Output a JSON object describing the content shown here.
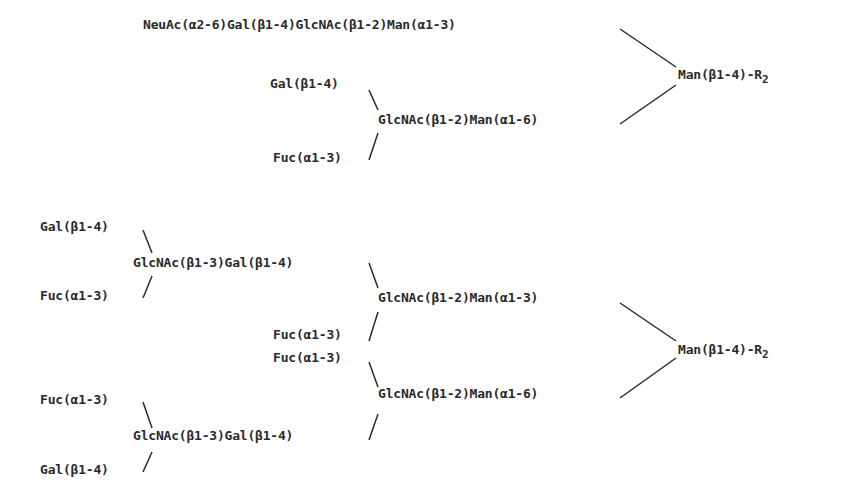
{
  "structure_1": {
    "branch_a3": "NeuAc(α2-6)Gal(β1-4)GlcNAc(β1-2)Man(α1-3)",
    "branch_a6_gal": "Gal(β1-4)",
    "branch_a6_core": "GlcNAc(β1-2)Man(α1-6)",
    "branch_a6_fuc": "Fuc(α1-3)",
    "core": "Man(β1-4)-R",
    "core_subscript": "2"
  },
  "structure_2": {
    "upper_outer_gal": "Gal(β1-4)",
    "upper_outer_core": "GlcNAc(β1-3)Gal(β1-4)",
    "upper_outer_fuc": "Fuc(α1-3)",
    "upper_a3": "GlcNAc(β1-2)Man(α1-3)",
    "upper_fuc": "Fuc(α1-3)",
    "lower_fuc": "Fuc(α1-3)",
    "lower_a6": "GlcNAc(β1-2)Man(α1-6)",
    "lower_outer_fuc": "Fuc(α1-3)",
    "lower_outer_core": "GlcNAc(β1-3)Gal(β1-4)",
    "lower_outer_gal": "Gal(β1-4)",
    "core": "Man(β1-4)-R",
    "core_subscript": "2"
  }
}
